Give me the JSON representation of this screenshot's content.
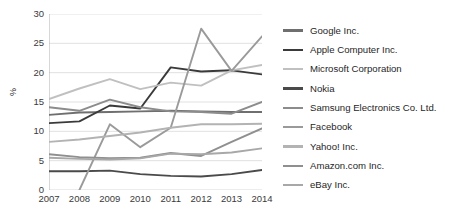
{
  "chart_data": {
    "type": "line",
    "title": "",
    "xlabel": "",
    "ylabel": "%",
    "x": [
      "2007",
      "2008",
      "2009",
      "2010",
      "2011",
      "2012",
      "2013",
      "2014"
    ],
    "categories": [
      "2007",
      "2008",
      "2009",
      "2010",
      "2011",
      "2012",
      "2013",
      "2014"
    ],
    "ylim": [
      0,
      30
    ],
    "yticks": [
      "0",
      "5",
      "10",
      "15",
      "20",
      "25",
      "30"
    ],
    "grid": true,
    "legend_position": "right",
    "series": [
      {
        "name": "Google Inc.",
        "color": "#6f6f6f",
        "values": [
          12.8,
          13.2,
          13.3,
          13.4,
          13.5,
          13.4,
          13.3,
          13.3
        ]
      },
      {
        "name": "Apple Computer Inc.",
        "color": "#3a3a3a",
        "values": [
          11.4,
          11.7,
          14.4,
          13.9,
          20.9,
          20.2,
          20.4,
          19.7
        ]
      },
      {
        "name": "Microsoft Corporation",
        "color": "#c0c0c0",
        "values": [
          15.5,
          17.3,
          18.9,
          17.2,
          18.3,
          17.8,
          20.4,
          21.3
        ]
      },
      {
        "name": "Nokia",
        "color": "#4a4a4a",
        "values": [
          3.2,
          3.2,
          3.3,
          2.7,
          2.4,
          2.3,
          2.7,
          3.4
        ]
      },
      {
        "name": "Samsung Electronics Co. Ltd.",
        "color": "#8c8c8c",
        "values": [
          14.1,
          13.5,
          15.4,
          14.1,
          13.4,
          13.3,
          13.0,
          15.0
        ]
      },
      {
        "name": "Facebook",
        "color": "#9a9a9a",
        "values": [
          null,
          0.0,
          11.2,
          7.3,
          10.6,
          27.5,
          20.3,
          26.2
        ]
      },
      {
        "name": "Yahoo! Inc.",
        "color": "#b3b3b3",
        "values": [
          8.2,
          8.6,
          9.2,
          9.8,
          10.6,
          11.2,
          11.2,
          11.3
        ]
      },
      {
        "name": "Amazon.com Inc.",
        "color": "#8f8f8f",
        "values": [
          6.1,
          5.6,
          5.4,
          5.5,
          6.3,
          5.8,
          8.2,
          10.5
        ]
      },
      {
        "name": "eBay Inc.",
        "color": "#a8a8a8",
        "values": [
          5.5,
          5.3,
          5.2,
          5.4,
          6.2,
          6.1,
          6.4,
          7.1
        ]
      }
    ]
  },
  "legend": {
    "items": [
      {
        "label": "Google Inc."
      },
      {
        "label": "Apple Computer Inc."
      },
      {
        "label": "Microsoft Corporation"
      },
      {
        "label": "Nokia"
      },
      {
        "label": "Samsung Electronics Co. Ltd."
      },
      {
        "label": "Facebook"
      },
      {
        "label": "Yahoo! Inc."
      },
      {
        "label": "Amazon.com Inc."
      },
      {
        "label": "eBay Inc."
      }
    ]
  },
  "axis": {
    "y_label": "%",
    "grid_color": "#d9d9d9",
    "axis_color": "#b0b0b0"
  }
}
